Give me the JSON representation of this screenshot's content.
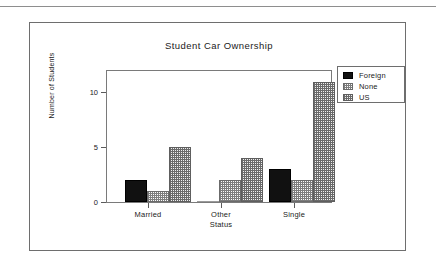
{
  "chart_data": {
    "type": "bar",
    "title": "Student Car Ownership",
    "xlabel": "",
    "ylabel": "Number of Students",
    "categories": [
      "Married",
      "Other\nStatus",
      "Single"
    ],
    "category_labels": [
      {
        "line1": "Married",
        "line2": ""
      },
      {
        "line1": "Other",
        "line2": "Status"
      },
      {
        "line1": "Single",
        "line2": ""
      }
    ],
    "series": [
      {
        "name": "Foreign",
        "values": [
          2,
          0,
          3
        ],
        "fill": "solid-black",
        "color": "#111111"
      },
      {
        "name": "None",
        "values": [
          1,
          2,
          2
        ],
        "fill": "light-checker",
        "color": "#7d7d7d"
      },
      {
        "name": "US",
        "values": [
          5,
          4,
          11
        ],
        "fill": "dense-checker",
        "color": "#6a6a6a"
      }
    ],
    "ylim": [
      0,
      12
    ],
    "yticks": [
      0,
      5,
      10
    ],
    "ytick_labels": [
      "0",
      "5",
      "10"
    ],
    "grid": false,
    "legend_position": "right-top",
    "legend_entries": [
      "Foreign",
      "None",
      "US"
    ]
  },
  "figure": {
    "border_color": "#6e6e6e",
    "background": "#ffffff",
    "rule_color": "#8e8e8e"
  }
}
